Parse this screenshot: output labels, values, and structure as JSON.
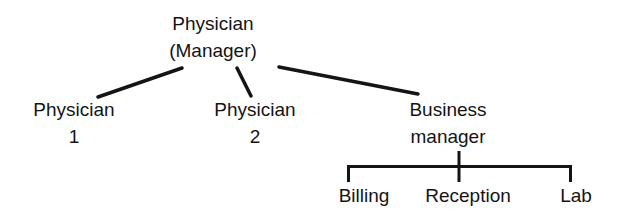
{
  "diagram": {
    "type": "org-chart",
    "colors": {
      "line": "#141414",
      "text": "#141414",
      "background": "#ffffff"
    },
    "root": {
      "id": "physician-manager",
      "lines": [
        "Physician",
        "(Manager)"
      ]
    },
    "level1": [
      {
        "id": "physician-1",
        "lines": [
          "Physician",
          "1"
        ]
      },
      {
        "id": "physician-2",
        "lines": [
          "Physician",
          "2"
        ]
      },
      {
        "id": "business-manager",
        "lines": [
          "Business",
          "manager"
        ]
      }
    ],
    "level2": [
      {
        "id": "billing",
        "parent": "business-manager",
        "lines": [
          "Billing"
        ]
      },
      {
        "id": "reception",
        "parent": "business-manager",
        "lines": [
          "Reception"
        ]
      },
      {
        "id": "lab",
        "parent": "business-manager",
        "lines": [
          "Lab"
        ]
      }
    ],
    "edges": [
      {
        "from": "physician-manager",
        "to": "physician-1"
      },
      {
        "from": "physician-manager",
        "to": "physician-2"
      },
      {
        "from": "physician-manager",
        "to": "business-manager"
      },
      {
        "from": "business-manager",
        "to": "billing"
      },
      {
        "from": "business-manager",
        "to": "reception"
      },
      {
        "from": "business-manager",
        "to": "lab"
      }
    ]
  }
}
